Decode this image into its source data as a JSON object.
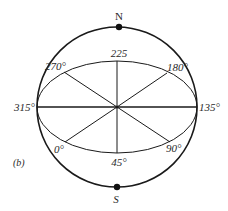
{
  "figure": {
    "panel_label": "(b)",
    "poles": {
      "north": "N",
      "south": "S"
    },
    "azimuth_labels": {
      "a0": "0°",
      "a45": "45°",
      "a90": "90°",
      "a135": "135°",
      "a180": "180°",
      "a225": "225",
      "a270": "270°",
      "a315": "315°"
    },
    "colors": {
      "stroke": "#1a1a1a",
      "text": "#2a2a2a",
      "background": "#ffffff"
    }
  }
}
